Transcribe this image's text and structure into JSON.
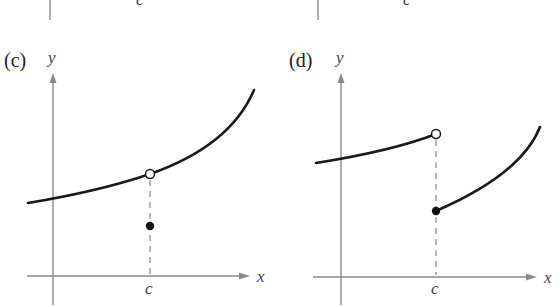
{
  "figure": {
    "top_partial": {
      "left_c_label": "c",
      "right_c_label": "c"
    },
    "panels": [
      {
        "id": "c",
        "label": "(c)",
        "y_axis_label": "y",
        "x_axis_label": "x",
        "c_label": "c",
        "description": "Continuous curve with a removable discontinuity at x=c: open circle on the curve, filled point below it."
      },
      {
        "id": "d",
        "label": "(d)",
        "y_axis_label": "y",
        "x_axis_label": "x",
        "c_label": "c",
        "description": "Jump discontinuity at x=c: left piece ends with open circle, right piece starts with a filled point lower down."
      }
    ]
  },
  "colors": {
    "axis": "#8a8a8a",
    "curve": "#1a1a1a",
    "background": "#ffffff"
  }
}
